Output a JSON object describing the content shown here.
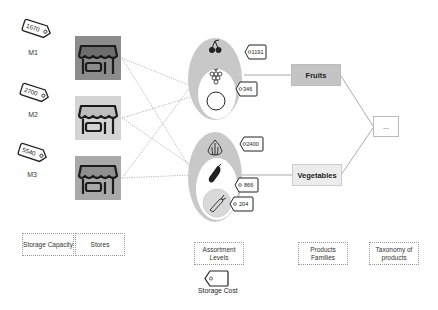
{
  "stores": [
    {
      "id": "M1",
      "label": "M1",
      "capacity": "1670",
      "fill": "#8c8c8c"
    },
    {
      "id": "M2",
      "label": "M2",
      "capacity": "2700",
      "fill": "#d4d4d4"
    },
    {
      "id": "M3",
      "label": "M3",
      "capacity": "5540",
      "fill": "#a9a9a9"
    }
  ],
  "assortment": {
    "fruits": {
      "outer_cost": "1191",
      "inner_cost": "346",
      "icons": [
        "cherry-icon",
        "grapes-icon",
        "apple-icon"
      ]
    },
    "vegetables": {
      "outer_cost": "2400",
      "inner_cost": "866",
      "innermost_cost": "204",
      "icons": [
        "garlic-icon",
        "eggplant-icon",
        "carrot-icon"
      ]
    }
  },
  "families": {
    "fruits": "Fruits",
    "vegetables": "Vegetables"
  },
  "taxonomy_node": "...",
  "legend": {
    "storage_capacity": "Storage Capacity",
    "stores": "Stores",
    "assortment_levels": "Assortment Levels",
    "product_families": "Products Families",
    "taxonomy": "Taxonomy of products",
    "storage_cost": "Storage Cost"
  },
  "colors": {
    "oval_outer": "#c8c8c8",
    "oval_inner": "#ffffff",
    "carrot_circle": "#d9d9d9",
    "fruits_box": "#c4c4c4",
    "vegetables_box": "#ececec",
    "connector": "#9a9a9a"
  }
}
